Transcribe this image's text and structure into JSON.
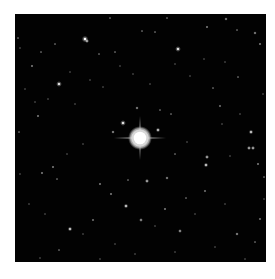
{
  "image": {
    "type": "astronomical star field",
    "background_color": "#020202",
    "frame_color": "#ffffff",
    "field": {
      "x": 15,
      "y": 14,
      "width": 251,
      "height": 248
    }
  },
  "central_star": {
    "x": 125,
    "y": 124,
    "radius": 9,
    "color": "#ffffff",
    "halo_color": "#d8d8d8",
    "spikes": {
      "horizontal_length": 26,
      "vertical_length": 22
    }
  },
  "stars": [
    {
      "x": 70,
      "y": 25,
      "r": 1.8,
      "b": 1.0
    },
    {
      "x": 72,
      "y": 27,
      "r": 1.2,
      "b": 0.8
    },
    {
      "x": 163,
      "y": 35,
      "r": 1.6,
      "b": 0.95
    },
    {
      "x": 44,
      "y": 70,
      "r": 1.6,
      "b": 0.95
    },
    {
      "x": 108,
      "y": 109,
      "r": 1.6,
      "b": 0.95
    },
    {
      "x": 143,
      "y": 116,
      "r": 1.3,
      "b": 0.8
    },
    {
      "x": 98,
      "y": 118,
      "r": 1.0,
      "b": 0.7
    },
    {
      "x": 236,
      "y": 118,
      "r": 1.3,
      "b": 0.85
    },
    {
      "x": 234,
      "y": 134,
      "r": 1.2,
      "b": 0.8
    },
    {
      "x": 238,
      "y": 134,
      "r": 1.2,
      "b": 0.8
    },
    {
      "x": 192,
      "y": 143,
      "r": 1.2,
      "b": 0.8
    },
    {
      "x": 191,
      "y": 151,
      "r": 1.3,
      "b": 0.85
    },
    {
      "x": 132,
      "y": 167,
      "r": 1.2,
      "b": 0.8
    },
    {
      "x": 152,
      "y": 164,
      "r": 1.0,
      "b": 0.65
    },
    {
      "x": 111,
      "y": 192,
      "r": 1.3,
      "b": 0.85
    },
    {
      "x": 55,
      "y": 215,
      "r": 1.3,
      "b": 0.85
    },
    {
      "x": 165,
      "y": 217,
      "r": 1.1,
      "b": 0.75
    },
    {
      "x": 126,
      "y": 206,
      "r": 1.1,
      "b": 0.7
    },
    {
      "x": 222,
      "y": 220,
      "r": 1.0,
      "b": 0.7
    },
    {
      "x": 17,
      "y": 52,
      "r": 0.9,
      "b": 0.6
    },
    {
      "x": 23,
      "y": 102,
      "r": 0.9,
      "b": 0.6
    },
    {
      "x": 38,
      "y": 153,
      "r": 0.9,
      "b": 0.6
    },
    {
      "x": 27,
      "y": 159,
      "r": 0.9,
      "b": 0.6
    },
    {
      "x": 42,
      "y": 165,
      "r": 0.8,
      "b": 0.5
    },
    {
      "x": 85,
      "y": 170,
      "r": 0.9,
      "b": 0.6
    },
    {
      "x": 96,
      "y": 180,
      "r": 0.9,
      "b": 0.6
    },
    {
      "x": 113,
      "y": 166,
      "r": 0.8,
      "b": 0.5
    },
    {
      "x": 78,
      "y": 206,
      "r": 0.9,
      "b": 0.55
    },
    {
      "x": 150,
      "y": 195,
      "r": 0.9,
      "b": 0.6
    },
    {
      "x": 171,
      "y": 184,
      "r": 0.8,
      "b": 0.5
    },
    {
      "x": 190,
      "y": 177,
      "r": 0.9,
      "b": 0.55
    },
    {
      "x": 243,
      "y": 150,
      "r": 0.9,
      "b": 0.6
    },
    {
      "x": 249,
      "y": 163,
      "r": 0.8,
      "b": 0.5
    },
    {
      "x": 245,
      "y": 205,
      "r": 0.9,
      "b": 0.55
    },
    {
      "x": 240,
      "y": 228,
      "r": 0.8,
      "b": 0.5
    },
    {
      "x": 122,
      "y": 94,
      "r": 1.0,
      "b": 0.65
    },
    {
      "x": 145,
      "y": 96,
      "r": 0.8,
      "b": 0.5
    },
    {
      "x": 156,
      "y": 100,
      "r": 0.8,
      "b": 0.5
    },
    {
      "x": 205,
      "y": 92,
      "r": 0.9,
      "b": 0.55
    },
    {
      "x": 223,
      "y": 63,
      "r": 0.8,
      "b": 0.5
    },
    {
      "x": 198,
      "y": 74,
      "r": 0.8,
      "b": 0.5
    },
    {
      "x": 192,
      "y": 13,
      "r": 0.9,
      "b": 0.6
    },
    {
      "x": 211,
      "y": 5,
      "r": 1.0,
      "b": 0.65
    },
    {
      "x": 240,
      "y": 19,
      "r": 1.0,
      "b": 0.65
    },
    {
      "x": 245,
      "y": 30,
      "r": 0.9,
      "b": 0.6
    },
    {
      "x": 222,
      "y": 16,
      "r": 0.8,
      "b": 0.5
    },
    {
      "x": 127,
      "y": 17,
      "r": 0.8,
      "b": 0.5
    },
    {
      "x": 140,
      "y": 18,
      "r": 0.8,
      "b": 0.5
    },
    {
      "x": 152,
      "y": 4,
      "r": 0.8,
      "b": 0.5
    },
    {
      "x": 95,
      "y": 4,
      "r": 0.8,
      "b": 0.5
    },
    {
      "x": 40,
      "y": 30,
      "r": 0.8,
      "b": 0.5
    },
    {
      "x": 26,
      "y": 38,
      "r": 0.8,
      "b": 0.5
    },
    {
      "x": 3,
      "y": 24,
      "r": 0.8,
      "b": 0.5
    },
    {
      "x": 5,
      "y": 34,
      "r": 0.7,
      "b": 0.4
    },
    {
      "x": 84,
      "y": 40,
      "r": 0.8,
      "b": 0.5
    },
    {
      "x": 100,
      "y": 38,
      "r": 0.8,
      "b": 0.5
    },
    {
      "x": 105,
      "y": 52,
      "r": 0.7,
      "b": 0.4
    },
    {
      "x": 55,
      "y": 58,
      "r": 0.7,
      "b": 0.4
    },
    {
      "x": 75,
      "y": 66,
      "r": 0.7,
      "b": 0.4
    },
    {
      "x": 60,
      "y": 90,
      "r": 0.7,
      "b": 0.4
    },
    {
      "x": 4,
      "y": 118,
      "r": 0.8,
      "b": 0.5
    },
    {
      "x": 10,
      "y": 75,
      "r": 0.7,
      "b": 0.4
    },
    {
      "x": 20,
      "y": 88,
      "r": 0.7,
      "b": 0.4
    },
    {
      "x": 33,
      "y": 85,
      "r": 0.7,
      "b": 0.4
    },
    {
      "x": 88,
      "y": 73,
      "r": 0.7,
      "b": 0.4
    },
    {
      "x": 118,
      "y": 60,
      "r": 0.7,
      "b": 0.4
    },
    {
      "x": 135,
      "y": 70,
      "r": 0.7,
      "b": 0.4
    },
    {
      "x": 160,
      "y": 50,
      "r": 0.7,
      "b": 0.4
    },
    {
      "x": 175,
      "y": 62,
      "r": 0.7,
      "b": 0.4
    },
    {
      "x": 189,
      "y": 45,
      "r": 0.7,
      "b": 0.4
    },
    {
      "x": 210,
      "y": 48,
      "r": 0.7,
      "b": 0.4
    },
    {
      "x": 225,
      "y": 100,
      "r": 0.7,
      "b": 0.4
    },
    {
      "x": 160,
      "y": 140,
      "r": 0.8,
      "b": 0.5
    },
    {
      "x": 172,
      "y": 128,
      "r": 0.7,
      "b": 0.4
    },
    {
      "x": 207,
      "y": 110,
      "r": 0.7,
      "b": 0.4
    },
    {
      "x": 215,
      "y": 142,
      "r": 0.7,
      "b": 0.4
    },
    {
      "x": 68,
      "y": 130,
      "r": 0.7,
      "b": 0.4
    },
    {
      "x": 52,
      "y": 140,
      "r": 0.7,
      "b": 0.4
    },
    {
      "x": 14,
      "y": 190,
      "r": 0.7,
      "b": 0.4
    },
    {
      "x": 30,
      "y": 200,
      "r": 0.7,
      "b": 0.4
    },
    {
      "x": 44,
      "y": 236,
      "r": 0.8,
      "b": 0.5
    },
    {
      "x": 25,
      "y": 244,
      "r": 0.7,
      "b": 0.4
    },
    {
      "x": 100,
      "y": 230,
      "r": 0.7,
      "b": 0.4
    },
    {
      "x": 120,
      "y": 240,
      "r": 0.7,
      "b": 0.4
    },
    {
      "x": 160,
      "y": 238,
      "r": 0.7,
      "b": 0.4
    },
    {
      "x": 200,
      "y": 233,
      "r": 0.7,
      "b": 0.4
    },
    {
      "x": 230,
      "y": 245,
      "r": 0.7,
      "b": 0.4
    },
    {
      "x": 180,
      "y": 200,
      "r": 0.7,
      "b": 0.4
    },
    {
      "x": 210,
      "y": 190,
      "r": 0.7,
      "b": 0.4
    },
    {
      "x": 140,
      "y": 212,
      "r": 0.7,
      "b": 0.4
    },
    {
      "x": 68,
      "y": 220,
      "r": 0.7,
      "b": 0.4
    },
    {
      "x": 85,
      "y": 245,
      "r": 0.7,
      "b": 0.4
    },
    {
      "x": 5,
      "y": 160,
      "r": 0.7,
      "b": 0.4
    },
    {
      "x": 248,
      "y": 80,
      "r": 0.7,
      "b": 0.4
    },
    {
      "x": 249,
      "y": 185,
      "r": 0.7,
      "b": 0.4
    }
  ]
}
